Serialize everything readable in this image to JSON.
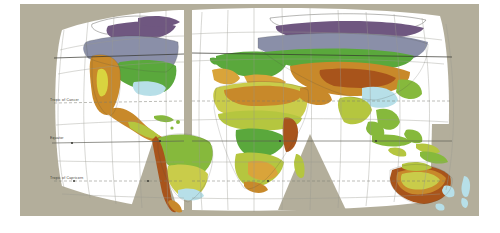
{
  "map": {
    "title": "World Climate and Vegetation Regions",
    "projection": "interrupted homolosine (Goode-style)",
    "frame": {
      "x": 20,
      "y": 4,
      "width": 459,
      "height": 212
    },
    "background_color": "#b3ae9b",
    "ocean_color": "#ffffff",
    "graticule_color": "#9a9a92",
    "coastline_color": "#4a4a44",
    "gore_color": "#b3ae9b"
  },
  "latitude_lines": [
    {
      "name": "tropic-of-cancer",
      "label": "Tropic of Cancer",
      "y": 99,
      "style": "dashed"
    },
    {
      "name": "equator",
      "label": "Equator",
      "y": 139,
      "style": "solid"
    },
    {
      "name": "tropic-of-capricorn",
      "label": "Tropic of Capricorn",
      "y": 177,
      "style": "dashed"
    }
  ],
  "legend_colors": {
    "tundra": "#6f5780",
    "boreal_forest": "#8a8fa8",
    "temperate_forest": "#5aa83c",
    "grassland_steppe": "#c9cc4a",
    "savanna": "#b5c63f",
    "tropical_rainforest": "#86b93c",
    "desert_arid": "#c8892a",
    "semi_arid": "#b06a1c",
    "highland_mountain": "#b7dfe8",
    "mediterranean": "#d9a43a",
    "ice_sheet": "#ffffff",
    "dry_steppe": "#a8541b"
  },
  "continents": [
    {
      "name": "north-america",
      "biomes": [
        "tundra",
        "boreal_forest",
        "temperate_forest",
        "desert_arid",
        "highland_mountain",
        "grassland_steppe"
      ]
    },
    {
      "name": "south-america",
      "biomes": [
        "tropical_rainforest",
        "savanna",
        "semi_arid",
        "highland_mountain",
        "grassland_steppe"
      ]
    },
    {
      "name": "africa",
      "biomes": [
        "desert_arid",
        "savanna",
        "tropical_rainforest",
        "semi_arid",
        "mediterranean"
      ]
    },
    {
      "name": "eurasia",
      "biomes": [
        "tundra",
        "boreal_forest",
        "temperate_forest",
        "desert_arid",
        "dry_steppe",
        "highland_mountain",
        "savanna"
      ]
    },
    {
      "name": "australia",
      "biomes": [
        "desert_arid",
        "semi_arid",
        "grassland_steppe",
        "savanna",
        "highland_mountain"
      ]
    },
    {
      "name": "southeast-asia",
      "biomes": [
        "tropical_rainforest",
        "savanna"
      ]
    },
    {
      "name": "greenland",
      "biomes": [
        "ice_sheet",
        "tundra"
      ]
    }
  ]
}
